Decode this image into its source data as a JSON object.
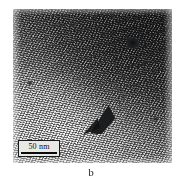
{
  "figure": {
    "panel_label": "b",
    "caption_position": "below-image",
    "background_color": "#ffffff"
  },
  "micrograph": {
    "type": "TEM electron micrograph",
    "description": "Grainy nanoparticle speckle texture with a darker contrast phase toward the upper right and a lighter amorphous region in the lower left separated by a soft diagonal boundary",
    "features": [
      {
        "name": "dark-wedge",
        "description": "dark triangular wedge artifact near lower centre"
      },
      {
        "name": "dark-blob",
        "description": "dark agglomerate blob in upper right quadrant"
      },
      {
        "name": "dark-speck-left",
        "description": "small dark speck at mid left"
      }
    ],
    "tone": {
      "light_region": "#d8d8d8",
      "mid_region": "#9a9a9a",
      "dark_region": "#4a4a4a",
      "darkest_feature": "#101214"
    }
  },
  "scale_bar": {
    "value": "50",
    "unit": "nm",
    "label": "50 nm",
    "box_background": "#e8e8e4",
    "bar_color": "#0a0a0a",
    "border_color": "#1a1a1a"
  }
}
